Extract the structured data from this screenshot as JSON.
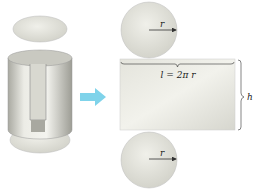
{
  "diagram": {
    "labels": {
      "radius_top": "r",
      "radius_bottom": "r",
      "length": "l = 2π r",
      "height": "h"
    },
    "colors": {
      "surface": "#e6e6df",
      "shade": "#b8b8b0",
      "arrow": "#7fd3ea",
      "line": "#333333"
    }
  }
}
